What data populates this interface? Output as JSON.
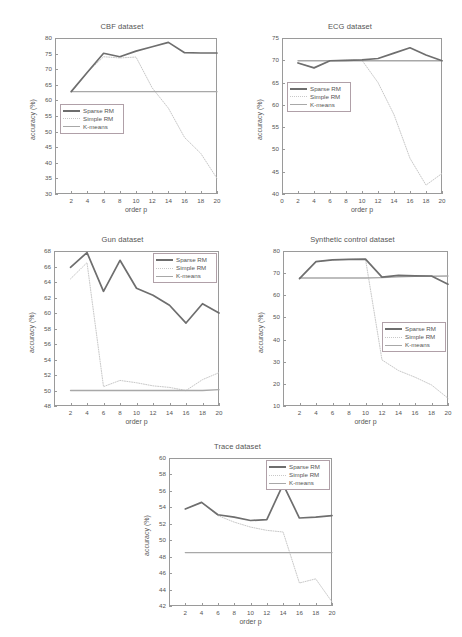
{
  "figure": {
    "axis_label_x": "order p",
    "axis_label_y": "accuracy (%)",
    "legend_labels": [
      "Sparse RM",
      "Simple RM",
      "K-means"
    ],
    "colors": {
      "sparse_rm": "#6e6e6e",
      "simple_rm": "#c8c8c8",
      "k_means": "#a8a8a8",
      "axis": "#9a9a9a",
      "text": "#555555"
    }
  },
  "chart_data": [
    {
      "type": "line",
      "title": "CBF dataset",
      "xlabel": "order p",
      "ylabel": "accuracy (%)",
      "x": [
        2,
        4,
        6,
        8,
        10,
        12,
        14,
        16,
        18,
        20
      ],
      "xlim": [
        0,
        20
      ],
      "ylim": [
        30,
        80
      ],
      "xticks": [
        2,
        4,
        6,
        8,
        10,
        12,
        14,
        16,
        18,
        20
      ],
      "yticks": [
        30,
        35,
        40,
        45,
        50,
        55,
        60,
        65,
        70,
        75,
        80
      ],
      "grid": false,
      "legend_position": "center-left",
      "series": [
        {
          "name": "Sparse RM",
          "values": [
            62.8,
            69.0,
            75.1,
            74.0,
            75.8,
            77.2,
            78.6,
            75.3,
            75.2,
            75.2
          ]
        },
        {
          "name": "Simple RM",
          "values": [
            62.8,
            69.0,
            74.0,
            73.6,
            73.9,
            64.0,
            57.5,
            48.1,
            43.0,
            35.0
          ]
        },
        {
          "name": "K-means",
          "values": [
            62.8,
            62.8,
            62.8,
            62.8,
            62.8,
            62.8,
            62.8,
            62.8,
            62.8,
            62.8
          ]
        }
      ]
    },
    {
      "type": "line",
      "title": "ECG dataset",
      "xlabel": "order p",
      "ylabel": "accuracy (%)",
      "x": [
        2,
        4,
        6,
        8,
        10,
        12,
        14,
        16,
        18,
        20
      ],
      "xlim": [
        0,
        20
      ],
      "ylim": [
        40,
        75
      ],
      "xticks": [
        0,
        2,
        4,
        6,
        8,
        10,
        12,
        14,
        16,
        18,
        20
      ],
      "yticks": [
        40,
        45,
        50,
        55,
        60,
        65,
        70,
        75
      ],
      "grid": false,
      "legend_position": "center-left",
      "series": [
        {
          "name": "Sparse RM",
          "values": [
            69.4,
            68.3,
            69.9,
            70.0,
            70.1,
            70.4,
            71.6,
            72.8,
            71.2,
            69.9
          ]
        },
        {
          "name": "Simple RM",
          "values": [
            69.4,
            68.3,
            69.9,
            70.0,
            70.0,
            65.0,
            57.8,
            48.0,
            42.0,
            44.6
          ]
        },
        {
          "name": "K-means",
          "values": [
            69.9,
            69.9,
            69.9,
            69.9,
            69.9,
            69.9,
            69.9,
            69.9,
            69.9,
            69.9
          ]
        }
      ]
    },
    {
      "type": "line",
      "title": "Gun dataset",
      "xlabel": "order p",
      "ylabel": "accuracy (%)",
      "x": [
        2,
        4,
        6,
        8,
        10,
        12,
        14,
        16,
        18,
        20
      ],
      "xlim": [
        0,
        20
      ],
      "ylim": [
        48,
        68
      ],
      "xticks": [
        2,
        4,
        6,
        8,
        10,
        12,
        14,
        16,
        18,
        20
      ],
      "yticks": [
        48,
        50,
        52,
        54,
        56,
        58,
        60,
        62,
        64,
        66,
        68
      ],
      "grid": false,
      "legend_position": "top-right",
      "series": [
        {
          "name": "Sparse RM",
          "values": [
            65.9,
            67.8,
            62.8,
            66.8,
            63.2,
            62.3,
            61.0,
            58.7,
            61.2,
            60.0
          ]
        },
        {
          "name": "Simple RM",
          "values": [
            64.4,
            66.5,
            50.5,
            51.3,
            51.0,
            50.6,
            50.4,
            50.0,
            51.4,
            52.3
          ]
        },
        {
          "name": "K-means",
          "values": [
            50.0,
            50.0,
            50.0,
            50.0,
            50.0,
            50.0,
            50.0,
            50.0,
            50.0,
            50.1
          ]
        }
      ]
    },
    {
      "type": "line",
      "title": "Synthetic control dataset",
      "xlabel": "order p",
      "ylabel": "accuracy (%)",
      "x": [
        2,
        4,
        6,
        8,
        10,
        12,
        14,
        16,
        18,
        20
      ],
      "xlim": [
        0,
        20
      ],
      "ylim": [
        10,
        80
      ],
      "xticks": [
        2,
        4,
        6,
        8,
        10,
        12,
        14,
        16,
        18,
        20
      ],
      "yticks": [
        10,
        20,
        30,
        40,
        50,
        60,
        70,
        80
      ],
      "grid": false,
      "legend_position": "center-right",
      "series": [
        {
          "name": "Sparse RM",
          "values": [
            67.5,
            75.2,
            76.0,
            76.2,
            76.3,
            68.2,
            69.0,
            68.8,
            68.7,
            65.0
          ]
        },
        {
          "name": "Simple RM",
          "values": [
            67.5,
            75.2,
            76.0,
            76.2,
            76.3,
            30.8,
            26.0,
            23.0,
            19.5,
            13.5
          ]
        },
        {
          "name": "K-means",
          "values": [
            67.8,
            67.8,
            67.8,
            67.8,
            67.8,
            68.0,
            68.3,
            68.5,
            68.6,
            68.7
          ]
        }
      ]
    },
    {
      "type": "line",
      "title": "Trace dataset",
      "xlabel": "order p",
      "ylabel": "accuracy (%)",
      "x": [
        2,
        4,
        6,
        8,
        10,
        12,
        14,
        16,
        18,
        20
      ],
      "xlim": [
        0,
        20
      ],
      "ylim": [
        42,
        60
      ],
      "xticks": [
        2,
        4,
        6,
        8,
        10,
        12,
        14,
        16,
        18,
        20
      ],
      "yticks": [
        42,
        44,
        46,
        48,
        50,
        52,
        54,
        56,
        58,
        60
      ],
      "grid": false,
      "legend_position": "top-right",
      "series": [
        {
          "name": "Sparse RM",
          "values": [
            53.8,
            54.6,
            53.1,
            52.8,
            52.4,
            52.5,
            56.8,
            52.7,
            52.8,
            53.0
          ]
        },
        {
          "name": "Simple RM",
          "values": [
            53.8,
            54.6,
            53.0,
            52.2,
            51.6,
            51.2,
            51.0,
            44.8,
            45.3,
            42.5
          ]
        },
        {
          "name": "K-means",
          "values": [
            48.5,
            48.5,
            48.5,
            48.5,
            48.5,
            48.5,
            48.5,
            48.5,
            48.5,
            48.5
          ]
        }
      ]
    }
  ]
}
